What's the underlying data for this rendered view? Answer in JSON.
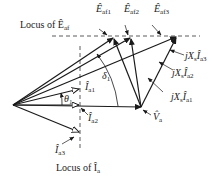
{
  "diagram": {
    "colors": {
      "stroke": "#1a1a1a",
      "dashed": "#333333",
      "text": "#222222"
    },
    "origin": [
      13,
      105
    ],
    "locus_ef": {
      "label": "Locus of Ê",
      "label_sub": "af",
      "y": 36,
      "x1": 52,
      "x2": 200
    },
    "locus_ia": {
      "label": "Locus of Î",
      "label_sub": "a",
      "x": 80,
      "y1": 46,
      "y2": 150
    },
    "voltage": {
      "label": "V̂",
      "sub": "a",
      "tip": [
        141,
        107
      ]
    },
    "currents": [
      {
        "label": "Î",
        "sub": "a1",
        "tip": [
          79,
          89
        ]
      },
      {
        "label": "Î",
        "sub": "a2",
        "tip": [
          79,
          105
        ]
      },
      {
        "label": "Î",
        "sub": "a3",
        "tip": [
          79,
          132
        ]
      }
    ],
    "emfs": [
      {
        "label": "Ê",
        "sub": "af1",
        "tip": [
          113,
          37
        ]
      },
      {
        "label": "Ê",
        "sub": "af2",
        "tip": [
          130,
          37
        ]
      },
      {
        "label": "Ê",
        "sub": "af3",
        "tip": [
          177,
          36
        ]
      }
    ],
    "drops": [
      {
        "label": "jX",
        "sub_s": "s",
        "i": "Î",
        "sub": "a1"
      },
      {
        "label": "jX",
        "sub_s": "s",
        "i": "Î",
        "sub": "a2"
      },
      {
        "label": "jX",
        "sub_s": "s",
        "i": "Î",
        "sub": "a3"
      }
    ],
    "angles": {
      "theta": "θ",
      "theta_sub": "1",
      "delta": "δ",
      "delta_sub": "1"
    }
  }
}
